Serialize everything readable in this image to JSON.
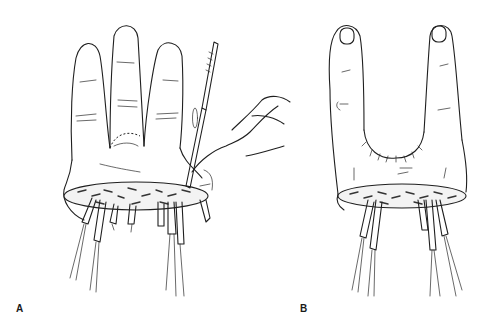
{
  "figure": {
    "panels": [
      {
        "label": "A",
        "description": "Hand with three fingers; scalpel incising at the web while a second hand retracts; amputation stump with tagged tendons and nerves below"
      },
      {
        "label": "B",
        "description": "Hand after ray resection with two remaining fingers, sutured web space, stump with tagged tendons and nerves below"
      }
    ],
    "colors": {
      "ink": "#1f1f1f",
      "background": "#ffffff"
    }
  }
}
